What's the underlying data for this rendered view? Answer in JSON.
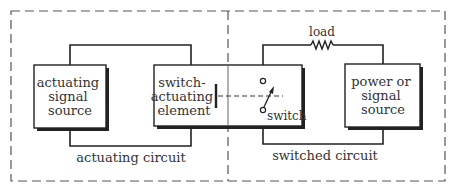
{
  "diagram": {
    "title": "",
    "colors": {
      "line": "#222222",
      "dashed": "#555555",
      "text": "#333333",
      "background": "#ffffff"
    },
    "regions": [
      {
        "id": "actuating-circuit",
        "label": "actuating circuit"
      },
      {
        "id": "switched-circuit",
        "label": "switched circuit"
      }
    ],
    "boxes": {
      "actuating_source": {
        "lines": [
          "actuating",
          "signal",
          "source"
        ]
      },
      "switch_element": {
        "lines": [
          "switch-",
          "actuating",
          "element"
        ]
      },
      "power_source": {
        "lines": [
          "power or",
          "signal",
          "source"
        ]
      }
    },
    "components": {
      "load": {
        "label": "load",
        "icon": "resistor-icon"
      },
      "switch": {
        "label": "switch",
        "icon": "switch-icon"
      }
    }
  }
}
